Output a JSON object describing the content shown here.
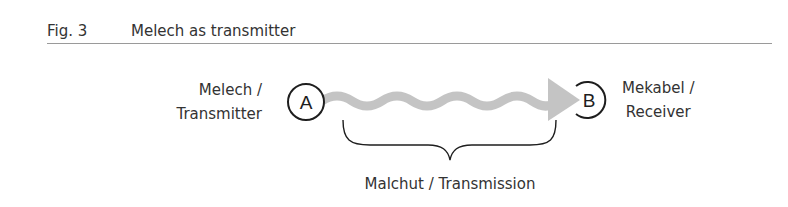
{
  "figure": {
    "number": "Fig. 3",
    "title": "Melech as transmitter"
  },
  "nodes": {
    "a": {
      "letter": "A",
      "line1": "Melech /",
      "line2": "Transmitter"
    },
    "b": {
      "letter": "B",
      "line1": "Mekabel /",
      "line2": "Receiver"
    }
  },
  "transmission": {
    "label": "Malchut / Transmission"
  },
  "colors": {
    "wave": "#c4c4c4",
    "stroke": "#1e1e1e",
    "rule": "#9a9a9a"
  }
}
